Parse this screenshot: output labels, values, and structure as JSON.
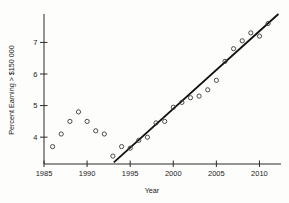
{
  "chart": {
    "y_axis_label": "Percent Earning > $150 000",
    "x_axis_label": "Year"
  },
  "chart_data": {
    "type": "scatter",
    "title": "",
    "xlabel": "Year",
    "ylabel": "Percent Earning > $150 000",
    "x": [
      1986,
      1987,
      1988,
      1989,
      1990,
      1991,
      1992,
      1993,
      1994,
      1995,
      1996,
      1997,
      1998,
      1999,
      2000,
      2001,
      2002,
      2003,
      2004,
      2005,
      2006,
      2007,
      2008,
      2009,
      2010,
      2011
    ],
    "y": [
      3.7,
      4.1,
      4.5,
      4.8,
      4.5,
      4.2,
      4.1,
      3.4,
      3.7,
      3.65,
      3.9,
      4.0,
      4.45,
      4.5,
      4.95,
      5.1,
      5.25,
      5.3,
      5.5,
      5.8,
      6.4,
      6.8,
      7.05,
      7.3,
      7.2,
      7.6
    ],
    "x_ticks": [
      1985,
      1990,
      1995,
      2000,
      2005,
      2010
    ],
    "y_ticks": [
      4,
      5,
      6,
      7
    ],
    "xlim": [
      1985,
      2012.5
    ],
    "ylim": [
      3.15,
      7.9
    ],
    "grid": false,
    "legend": "none",
    "trendline": {
      "x1": 1993.1,
      "y1": 3.2,
      "x2": 2012.2,
      "y2": 7.9
    },
    "colors": {
      "point_stroke": "#3a3a3a",
      "trendline": "#111111",
      "axis": "#2b2b2b",
      "label": "#222222"
    }
  }
}
